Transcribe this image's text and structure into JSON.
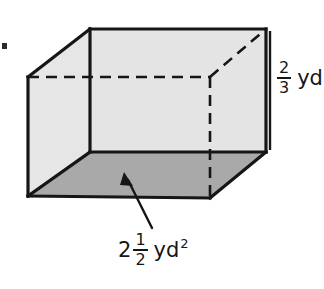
{
  "figure": {
    "shape_name": "rectangular-prism",
    "colors": {
      "outline": "#161616",
      "front_face_fill": "#e4e4e4",
      "top_face_fill": "#e0e0e0",
      "base_face_fill": "#a9a9a9",
      "background": "#ffffff",
      "label_text": "#161616"
    }
  },
  "labels": {
    "height": {
      "name": "height-label",
      "numerator": "2",
      "denominator": "3",
      "unit": "yd",
      "full_text": "2/3 yd"
    },
    "base_area": {
      "name": "base-area-label",
      "whole": "2",
      "numerator": "1",
      "denominator": "2",
      "unit": "yd",
      "exponent": "2",
      "full_text": "2 1/2 yd²"
    }
  },
  "annotations": {
    "arrow": {
      "name": "base-area-arrow",
      "points_to": "shaded-base-face"
    },
    "bullet_mark": {
      "name": "bullet-mark",
      "text": ""
    }
  }
}
